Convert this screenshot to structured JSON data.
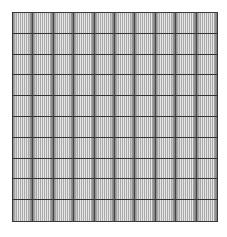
{
  "pattern": {
    "type": "grid",
    "rows": 10,
    "columns": 10,
    "colors": {
      "background": "#ffffff",
      "grid_line": "#333333",
      "stripe_light": "#e6e6e6",
      "stripe_dark": "#a9a9a9"
    }
  }
}
